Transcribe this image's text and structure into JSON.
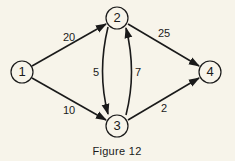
{
  "figure": {
    "caption": "Figure 12",
    "colors": {
      "background": "#f7f4ea",
      "ink": "#1a1a1a"
    }
  },
  "nodes": [
    {
      "id": "1",
      "label": "1",
      "x": 22,
      "y": 72
    },
    {
      "id": "2",
      "label": "2",
      "x": 117,
      "y": 18
    },
    {
      "id": "3",
      "label": "3",
      "x": 117,
      "y": 126
    },
    {
      "id": "4",
      "label": "4",
      "x": 210,
      "y": 72
    }
  ],
  "edges": [
    {
      "from": "1",
      "to": "2",
      "weight": "20"
    },
    {
      "from": "1",
      "to": "3",
      "weight": "10"
    },
    {
      "from": "2",
      "to": "3",
      "weight": "5"
    },
    {
      "from": "3",
      "to": "2",
      "weight": "7"
    },
    {
      "from": "2",
      "to": "4",
      "weight": "25"
    },
    {
      "from": "3",
      "to": "4",
      "weight": "2"
    }
  ]
}
